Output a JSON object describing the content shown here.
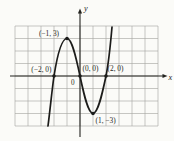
{
  "chart_data": {
    "type": "line",
    "curve_shape": "smooth cubic-style curve falling off bottom-left, cresting and dipping, rising off top-right",
    "points": [
      {
        "x": -2,
        "y": 0,
        "label": "(−2, 0)"
      },
      {
        "x": -1,
        "y": 3,
        "label": "(−1, 3)"
      },
      {
        "x": 0,
        "y": 0,
        "label": "(0, 0)"
      },
      {
        "x": 1,
        "y": -3,
        "label": "(1, −3)"
      },
      {
        "x": 2,
        "y": 0,
        "label": "(2, 0)"
      }
    ],
    "xlabel": "x",
    "ylabel": "y",
    "origin_label": "0",
    "xlim": [
      -5,
      6
    ],
    "ylim": [
      -4,
      4
    ],
    "grid": true,
    "legend": "none",
    "colors": {
      "curve": "#1c1c1a",
      "grid": "#a3a39e",
      "text": "#2a2a26"
    }
  }
}
